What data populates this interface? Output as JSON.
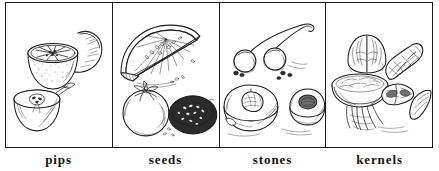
{
  "figure": {
    "kind": "four-panel line-drawing illustration chart",
    "background_color": "#ffffff",
    "ink_color": "#1d1d1d",
    "border_color": "#1a1a1a",
    "panel_count": 4
  },
  "panels": [
    {
      "id": "panel-pips",
      "label": "pips",
      "art_name": "pips-illustration",
      "subjects": [
        "halved orange",
        "orange wedge",
        "halved apple with pips"
      ]
    },
    {
      "id": "panel-seeds",
      "label": "seeds",
      "art_name": "seeds-illustration",
      "subjects": [
        "melon wedge with seeds",
        "whole tomato",
        "halved tomato with seeds"
      ]
    },
    {
      "id": "panel-stones",
      "label": "stones",
      "art_name": "stones-illustration",
      "subjects": [
        "cherries on stem",
        "halved peach with stone",
        "halved apricot with stone"
      ]
    },
    {
      "id": "panel-kernels",
      "label": "kernels",
      "art_name": "kernels-illustration",
      "subjects": [
        "walnut halves",
        "peanut in shell",
        "almonds",
        "nut kernel slice"
      ]
    }
  ]
}
